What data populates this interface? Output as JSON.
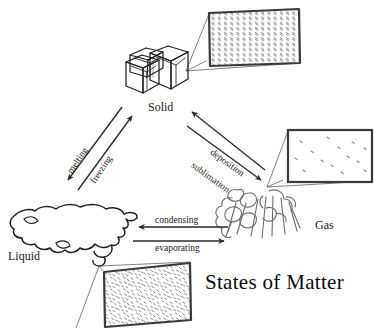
{
  "figure": {
    "title": "States of Matter",
    "background_color": "#ffffff",
    "ink_color": "#1a1a1a",
    "particle_color": "#6e6e6e",
    "box_border_color": "#333333"
  },
  "states": [
    {
      "id": "solid",
      "label": "Solid",
      "label_x": 148,
      "label_y": 101,
      "depiction": "three stacked ice cubes",
      "magnifier": {
        "name": "solid-particle-box",
        "arrangement": "regular close-packed lattice",
        "rows": 11,
        "columns": 14,
        "description": "particles tightly packed in an ordered repeating grid"
      }
    },
    {
      "id": "liquid",
      "label": "Liquid",
      "label_x": 8,
      "label_y": 250,
      "depiction": "irregular wavy puddle",
      "magnifier": {
        "name": "liquid-particle-box",
        "arrangement": "closely packed but disordered",
        "particle_count": 120,
        "description": "particles touching but randomly arranged"
      }
    },
    {
      "id": "gas",
      "label": "Gas",
      "label_x": 315,
      "label_y": 219,
      "depiction": "billowing steam cloud plume",
      "magnifier": {
        "name": "gas-particle-box",
        "arrangement": "widely separated and random",
        "particle_count": 14,
        "description": "particles far apart moving freely"
      }
    }
  ],
  "processes": [
    {
      "id": "melting",
      "label": "melting",
      "from": "solid",
      "to": "liquid",
      "direction": "down-left",
      "label_x": 70,
      "label_y": 168,
      "label_rotation": -56
    },
    {
      "id": "freezing",
      "label": "freezing",
      "from": "liquid",
      "to": "solid",
      "direction": "up-right",
      "label_x": 93,
      "label_y": 178,
      "label_rotation": -56
    },
    {
      "id": "deposition",
      "label": "deposition",
      "from": "gas",
      "to": "solid",
      "direction": "up-left",
      "label_x": 211,
      "label_y": 147,
      "label_rotation": 36
    },
    {
      "id": "sublimation",
      "label": "sublimation",
      "from": "solid",
      "to": "gas",
      "direction": "down-right",
      "label_x": 192,
      "label_y": 160,
      "label_rotation": 36
    },
    {
      "id": "condensing",
      "label": "condensing",
      "from": "gas",
      "to": "liquid",
      "direction": "left",
      "label_x": 155,
      "label_y": 216,
      "label_rotation": 0
    },
    {
      "id": "evaporating",
      "label": "evaporating",
      "from": "liquid",
      "to": "gas",
      "direction": "right",
      "label_x": 155,
      "label_y": 244,
      "label_rotation": 0
    }
  ]
}
